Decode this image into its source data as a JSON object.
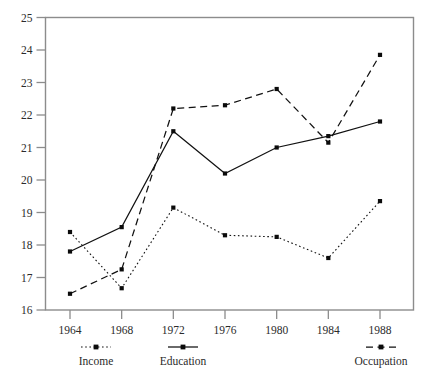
{
  "chart_data": {
    "type": "line",
    "title": "",
    "subtitle": "",
    "xlabel": "",
    "ylabel": "",
    "x": [
      1964,
      1968,
      1972,
      1976,
      1980,
      1984,
      1988
    ],
    "xtick_labels": [
      "1964",
      "1968",
      "1972",
      "1976",
      "1980",
      "1984",
      "1988"
    ],
    "ytick_labels": [
      "16",
      "17",
      "18",
      "19",
      "20",
      "21",
      "22",
      "23",
      "24",
      "25"
    ],
    "ylim": [
      16,
      25
    ],
    "xlim": [
      1962,
      1990
    ],
    "grid": false,
    "legend_position": "bottom",
    "series": [
      {
        "name": "Income",
        "style": "dotted",
        "marker": "square",
        "values": [
          18.4,
          16.67,
          19.15,
          18.3,
          18.25,
          17.6,
          19.35
        ]
      },
      {
        "name": "Education",
        "style": "solid",
        "marker": "square",
        "values": [
          17.8,
          18.55,
          21.5,
          20.2,
          21.0,
          21.35,
          21.8
        ]
      },
      {
        "name": "Occupation",
        "style": "dashed",
        "marker": "square",
        "values": [
          16.5,
          17.25,
          22.2,
          22.3,
          22.8,
          21.15,
          23.85
        ]
      }
    ]
  },
  "legend": {
    "items": [
      {
        "label": "Income",
        "style": "dotted"
      },
      {
        "label": "Education",
        "style": "solid"
      },
      {
        "label": "Occupation",
        "style": "dashed"
      }
    ]
  },
  "colors": {
    "line": "#111111",
    "marker": "#0b0b0b",
    "frame": "#8c8c8c",
    "text": "#2b2b2b",
    "background": "#ffffff"
  }
}
